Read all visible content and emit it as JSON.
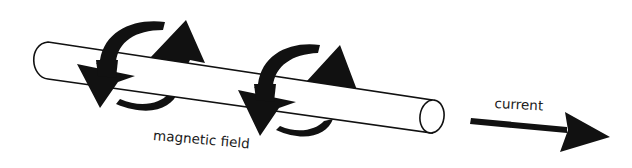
{
  "diagram": {
    "labels": {
      "magnetic_field": "magnetic field",
      "current": "current"
    },
    "elements": {
      "conductor": "cylindrical wire (rod)",
      "field_arrows": [
        "circular field arrow 1",
        "circular field arrow 2"
      ],
      "current_arrow": "arrow pointing right along wire direction"
    },
    "colors": {
      "ink": "#111111",
      "background": "#ffffff",
      "rod_fill": "#ffffff"
    }
  }
}
